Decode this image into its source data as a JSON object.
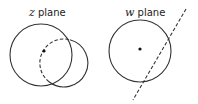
{
  "panels": [
    {
      "variable": "z",
      "label_rest": " plane",
      "big_circle": {
        "cx": 41,
        "cy": 55,
        "r": 31
      },
      "small_circle": {
        "cx": 64,
        "cy": 63,
        "r": 24
      },
      "dot": {
        "cx": 44,
        "cy": 51
      }
    },
    {
      "variable": "w",
      "label_rest": " plane",
      "circle": {
        "cx": 140,
        "cy": 51,
        "r": 31
      },
      "dot": {
        "cx": 140,
        "cy": 49
      },
      "dashed_line": {
        "x1": 186,
        "y1": 9,
        "x2": 133,
        "y2": 100
      }
    }
  ],
  "colors": {
    "stroke": "#333333",
    "background": "#ffffff"
  }
}
